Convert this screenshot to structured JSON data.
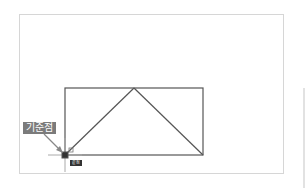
{
  "annotation": {
    "label": "기준점"
  },
  "snap_tooltip": {
    "label": "끝점"
  },
  "drawing": {
    "rectangle": {
      "x1": 65,
      "y1": 88,
      "x2": 203,
      "y2": 155
    },
    "triangle_apex": {
      "x": 134,
      "y": 88
    },
    "cursor": {
      "x": 65,
      "y": 155
    },
    "line_color": "#555555"
  }
}
